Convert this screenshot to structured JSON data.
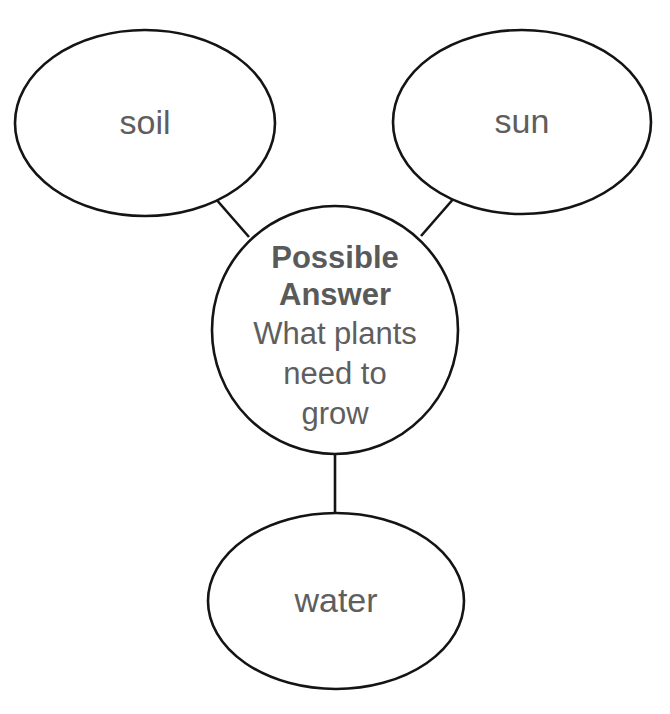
{
  "diagram": {
    "type": "concept-map",
    "background_color": "#ffffff",
    "stroke_color": "#141414",
    "text_color": "#5e5e5e",
    "center": {
      "id": "possible-answer",
      "heading_line_1": "Possible",
      "heading_line_2": "Answer",
      "body_line_1": "What plants",
      "body_line_2": "need to",
      "body_line_3": "grow",
      "shape": "circle",
      "cx": 335,
      "cy": 330,
      "rx": 123,
      "ry": 124
    },
    "branches": [
      {
        "id": "soil",
        "label": "soil",
        "shape": "ellipse",
        "cx": 145,
        "cy": 123,
        "rx": 130,
        "ry": 93,
        "connector": {
          "x1": 215,
          "y1": 198,
          "x2": 249,
          "y2": 237
        }
      },
      {
        "id": "sun",
        "label": "sun",
        "shape": "ellipse",
        "cx": 522,
        "cy": 122,
        "rx": 129,
        "ry": 92,
        "connector": {
          "x1": 455,
          "y1": 197,
          "x2": 421,
          "y2": 236
        }
      },
      {
        "id": "water",
        "label": "water",
        "shape": "ellipse",
        "cx": 336,
        "cy": 601,
        "rx": 128,
        "ry": 88,
        "connector": {
          "x1": 335,
          "y1": 455,
          "x2": 335,
          "y2": 514
        }
      }
    ]
  }
}
